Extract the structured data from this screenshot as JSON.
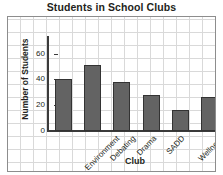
{
  "chart_data": {
    "type": "bar",
    "title": "Students in School Clubs",
    "xlabel": "Club",
    "ylabel": "Number of Students",
    "categories": [
      "Environment",
      "Debating",
      "Drama",
      "SADD",
      "Wellness",
      "Yearbook"
    ],
    "values": [
      40,
      51,
      38,
      28,
      16,
      26
    ],
    "yticks": [
      0,
      20,
      40,
      60
    ],
    "ytick_labels": [
      "0",
      "20",
      "40",
      "60"
    ],
    "ylim": [
      0,
      72
    ],
    "grid": true,
    "legend": false,
    "bar_color": "#636363",
    "bar_edge_color": "#333333",
    "grid_color": "#d9d9d9",
    "axis_color": "#3b3b3b",
    "text_color": "#231f20"
  }
}
